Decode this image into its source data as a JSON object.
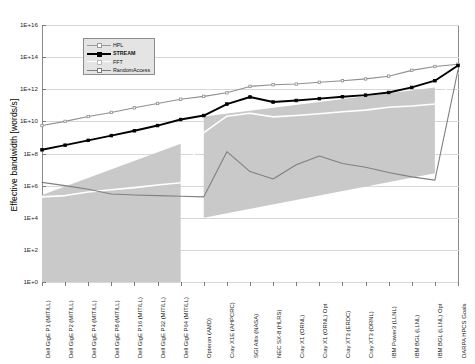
{
  "chart_data": {
    "type": "line",
    "title": "",
    "xlabel": "",
    "ylabel": "Effective bandwidth [words/s]",
    "yscale": "log",
    "ylim": [
      1,
      1e+16
    ],
    "ytick_labels": [
      "1E+16",
      "1E+14",
      "1E+12",
      "1E+10",
      "1E+8",
      "1E+6",
      "1E+4",
      "1E+2",
      "1E+0"
    ],
    "ytick_values": [
      1e+16,
      100000000000000.0,
      1000000000000.0,
      10000000000.0,
      100000000.0,
      1000000.0,
      10000.0,
      100,
      1
    ],
    "grid": true,
    "legend_position": "upper-left",
    "categories": [
      "Dell GigE P1 (MIT/LL)",
      "Dell GigE P2 (MIT/LL)",
      "Dell GigE P4 (MIT/LL)",
      "Dell GigE P8 (MIT/LL)",
      "Dell GigE P16 (MIT/LL)",
      "Dell GigE P32 (MIT/LL)",
      "Dell GigE P64 (MIT/LL)",
      "Opteron (AMD)",
      "Cray X1E (AHPCRC)",
      "SGI Altix (NASA)",
      "NEC SX-8 (HLRS)",
      "Cray X1 (ORNL)",
      "Cray X1 (ORNL) Opt",
      "Cray XT3 (ERDC)",
      "Cray XT3 (ORNL)",
      "IBM Power3 (LLNL)",
      "IBM BGL (LLNL)",
      "IBM BGL (LLNL) Opt",
      "DARPA HPCS Goals"
    ],
    "series": [
      {
        "name": "HPL",
        "color": "#8f8f8f",
        "marker": "square",
        "values": [
          5500000000.0,
          10000000000.0,
          20000000000.0,
          36000000000.0,
          70000000000.0,
          130000000000.0,
          240000000000.0,
          360000000000.0,
          600000000000.0,
          1500000000000.0,
          1900000000000.0,
          2100000000000.0,
          2700000000000.0,
          3400000000000.0,
          4400000000000.0,
          6500000000000.0,
          15000000000000.0,
          26000000000000.0,
          36000000000000.0
        ]
      },
      {
        "name": "STREAM",
        "color": "#000000",
        "marker": "square",
        "values": [
          170000000.0,
          330000000.0,
          660000000.0,
          1300000000.0,
          2600000000.0,
          5500000000.0,
          13000000000.0,
          23000000000.0,
          120000000000.0,
          330000000000.0,
          160000000000.0,
          200000000000.0,
          260000000000.0,
          340000000000.0,
          430000000000.0,
          630000000000.0,
          1300000000000.0,
          3400000000000.0,
          30000000000000.0
        ]
      },
      {
        "name": "FFT",
        "color": "#ffffff",
        "marker": "none",
        "values": [
          200000.0,
          240000.0,
          400000.0,
          550000.0,
          750000.0,
          1100000.0,
          1500000.0,
          2000000000.0,
          21000000000.0,
          32000000000.0,
          19000000000.0,
          23000000000.0,
          30000000000.0,
          40000000000.0,
          50000000000.0,
          75000000000.0,
          90000000000.0,
          120000000000.0,
          10000000000000.0
        ]
      },
      {
        "name": "RandomAccess",
        "color": "#808080",
        "marker": "none",
        "values": [
          1600000.0,
          1000000.0,
          600000.0,
          300000.0,
          260000.0,
          240000.0,
          220000.0,
          200000.0,
          130000000.0,
          7500000.0,
          2600000.0,
          20000000.0,
          70000000.0,
          24000000.0,
          14000000.0,
          6500000.0,
          3500000.0,
          2200000.0,
          16000000000000.0
        ]
      }
    ],
    "shaded_bands": [
      {
        "name": "left-cluster-band",
        "color": "#c9c9c9",
        "x_from": "Dell GigE P1 (MIT/LL)",
        "x_to": "Dell GigE P64 (MIT/LL)",
        "upper_from": 260000.0,
        "upper_to": 400000000.0,
        "lower": 1
      },
      {
        "name": "right-cluster-band",
        "color": "#c9c9c9",
        "x_from": "Opteron (AMD)",
        "x_to": "IBM BGL (LLNL) Opt",
        "upper_from": 20000000000.0,
        "upper_to": 1300000000000.0,
        "lower_from": 10000.0,
        "lower_to": 6000000.0
      }
    ],
    "annotations": []
  },
  "legend": {
    "items": [
      {
        "label": "HPL",
        "color": "#9a9a9a",
        "bold": false
      },
      {
        "label": "STREAM",
        "color": "#000000",
        "bold": true
      },
      {
        "label": "FFT",
        "color": "#ffffff",
        "bold": false
      },
      {
        "label": "RandomAccess",
        "color": "#7d7d7d",
        "bold": false
      }
    ]
  }
}
